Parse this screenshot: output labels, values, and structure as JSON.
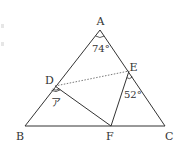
{
  "figure": {
    "colors": {
      "stroke": "#333333",
      "background": "#ffffff"
    },
    "vertices": {
      "A": {
        "label": "A",
        "x": 100,
        "y": 30
      },
      "B": {
        "label": "B",
        "x": 25,
        "y": 126
      },
      "C": {
        "label": "C",
        "x": 165,
        "y": 126
      },
      "D": {
        "label": "D",
        "x": 55,
        "y": 86
      },
      "E": {
        "label": "E",
        "x": 129,
        "y": 71
      },
      "F": {
        "label": "F",
        "x": 111,
        "y": 126
      }
    },
    "segments": [
      "AB",
      "BC",
      "CA",
      "DF",
      "EF"
    ],
    "dashed_segments": [
      "DE"
    ],
    "angles": {
      "A": {
        "label": "74°",
        "at": "A",
        "between": [
          "AB",
          "AC"
        ]
      },
      "E": {
        "label": "52°",
        "at": "E",
        "between": [
          "EA-extended",
          "EF"
        ]
      },
      "D": {
        "label": "ア",
        "at": "D",
        "between": [
          "DB",
          "DF"
        ],
        "unknown": true
      }
    }
  }
}
